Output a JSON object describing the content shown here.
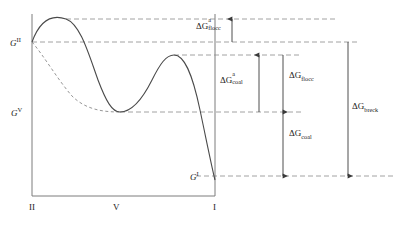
{
  "figure": {
    "title": "",
    "type": "free-energy-schematic"
  },
  "axes": {
    "x_ticks": [
      {
        "label": "II",
        "x": 32
      },
      {
        "label": "V",
        "x": 116
      },
      {
        "label": "I",
        "x": 215
      }
    ],
    "y_labels": [
      {
        "base": "G",
        "exponent": "II",
        "level": "G_II",
        "y": 42
      },
      {
        "base": "G",
        "exponent": "V",
        "level": "G_V",
        "y": 112
      },
      {
        "base": "G",
        "exponent": "I",
        "level": "G_I",
        "y": 176
      }
    ]
  },
  "levels": {
    "peak_flocc": {
      "y": 19,
      "name": "flocculation-barrier-top"
    },
    "g_two": {
      "y": 42,
      "name": "G-II-level"
    },
    "peak_coal": {
      "y": 55,
      "name": "coalescence-barrier-top"
    },
    "g_five": {
      "y": 112,
      "name": "G-V-level"
    },
    "g_one": {
      "y": 176,
      "name": "G-I-level"
    }
  },
  "arrows": [
    {
      "id": "dG-a-flocc",
      "label_base": "ΔG",
      "label_sup": "a",
      "label_sub": "flocc",
      "from_y": 42,
      "to_y": 19,
      "x": 232,
      "label_x": 196,
      "label_y": 24
    },
    {
      "id": "dG-a-coal",
      "label_base": "ΔG",
      "label_sup": "a",
      "label_sub": "coal",
      "from_y": 112,
      "to_y": 55,
      "x": 259,
      "label_x": 221,
      "label_y": 78
    },
    {
      "id": "dG-flocc",
      "label_base": "ΔG",
      "label_sup": "",
      "label_sub": "flocc",
      "from_y": 55,
      "to_y": 112,
      "x": 283,
      "label_x": 289,
      "label_y": 73
    },
    {
      "id": "dG-coal",
      "label_base": "ΔG",
      "label_sup": "",
      "label_sub": "coal",
      "from_y": 112,
      "to_y": 176,
      "x": 283,
      "label_x": 289,
      "label_y": 131
    },
    {
      "id": "dG-breck",
      "label_base": "ΔG",
      "label_sup": "",
      "label_sub": "breck",
      "from_y": 42,
      "to_y": 176,
      "x": 348,
      "label_x": 352,
      "label_y": 104
    }
  ],
  "curves": {
    "solid": {
      "name": "total-free-energy-curve",
      "path": "M32,42 C40,20 52,14 66,19 C80,24 88,52 98,80 C106,101 112,112 120,112 C132,112 142,100 152,80 C160,64 166,55 174,55 C184,55 192,72 200,110 C208,148 212,168 215,180"
    },
    "dashed": {
      "name": "alternative-free-energy-curve",
      "path": "M32,42 C44,56 58,80 72,96 C86,110 104,112 120,112"
    }
  },
  "colors": {
    "axis": "#7d7d7d",
    "curve": "#4a4a4a",
    "dashed": "#8a8a8a",
    "arrow": "#4a4a4a",
    "text": "#1a1a1a"
  }
}
